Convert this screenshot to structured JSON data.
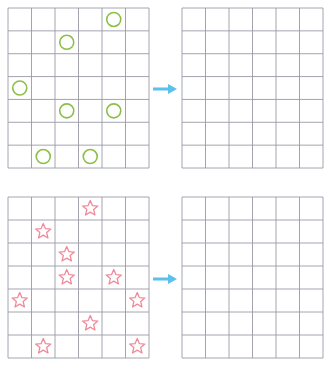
{
  "colors": {
    "grid_line": "#9a9aa8",
    "circle": "#8cbf4a",
    "star": "#f08a9a",
    "arrow": "#5bc0eb",
    "background": "#ffffff"
  },
  "grid": {
    "cols": 6,
    "rows": 7
  },
  "puzzles": [
    {
      "id": "circles",
      "symbol": "circle",
      "source": {
        "x": 8,
        "y": 8,
        "w": 141,
        "h": 160
      },
      "target": {
        "x": 182,
        "y": 8,
        "w": 141,
        "h": 160
      },
      "arrow": {
        "x": 152,
        "y": 82
      },
      "cells": [
        [
          0,
          4
        ],
        [
          1,
          2
        ],
        [
          3,
          0
        ],
        [
          4,
          2
        ],
        [
          4,
          4
        ],
        [
          6,
          1
        ],
        [
          6,
          3
        ]
      ]
    },
    {
      "id": "stars",
      "symbol": "star",
      "source": {
        "x": 8,
        "y": 197,
        "w": 141,
        "h": 161
      },
      "target": {
        "x": 182,
        "y": 197,
        "w": 141,
        "h": 161
      },
      "arrow": {
        "x": 152,
        "y": 272
      },
      "cells": [
        [
          0,
          3
        ],
        [
          1,
          1
        ],
        [
          2,
          2
        ],
        [
          3,
          2
        ],
        [
          3,
          4
        ],
        [
          4,
          0
        ],
        [
          4,
          5
        ],
        [
          5,
          3
        ],
        [
          6,
          1
        ],
        [
          6,
          5
        ]
      ]
    }
  ]
}
